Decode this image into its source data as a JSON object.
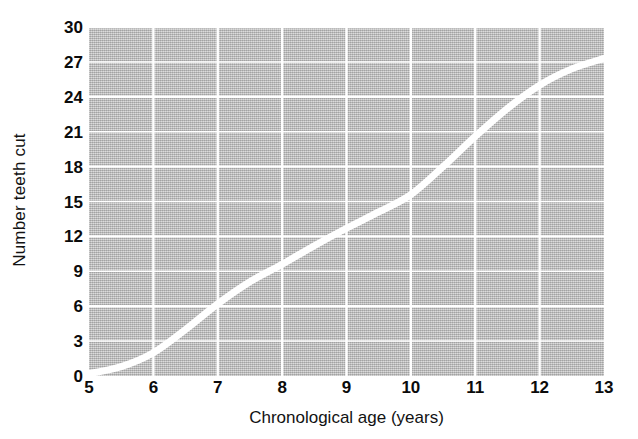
{
  "chart_data": {
    "type": "line",
    "title": "",
    "xlabel": "Chronological age (years)",
    "ylabel": "Number teeth cut",
    "xlim": [
      5,
      13
    ],
    "ylim": [
      0,
      30
    ],
    "xticks": [
      "5",
      "6",
      "7",
      "8",
      "9",
      "10",
      "11",
      "12",
      "13"
    ],
    "yticks": [
      "0",
      "3",
      "6",
      "9",
      "12",
      "15",
      "18",
      "21",
      "24",
      "27",
      "30"
    ],
    "grid": true,
    "legend": "none",
    "x": [
      5,
      5.5,
      6,
      6.5,
      7,
      7.5,
      8,
      8.5,
      9,
      9.5,
      10,
      10.5,
      11,
      11.5,
      12,
      12.5,
      13
    ],
    "values": [
      0.2,
      0.8,
      2.0,
      4.0,
      6.2,
      8.1,
      9.6,
      11.2,
      12.7,
      14.1,
      15.6,
      18.0,
      20.6,
      23.0,
      25.0,
      26.4,
      27.3
    ],
    "series": [
      {
        "name": "Number teeth cut",
        "color": "#ffffff",
        "values": [
          0.2,
          0.8,
          2.0,
          4.0,
          6.2,
          8.1,
          9.6,
          11.2,
          12.7,
          14.1,
          15.6,
          18.0,
          20.6,
          23.0,
          25.0,
          26.4,
          27.3
        ]
      }
    ],
    "plot_background": "#b9b9b9",
    "grid_color": "#ffffff",
    "line_color": "#ffffff",
    "line_width": 7
  }
}
